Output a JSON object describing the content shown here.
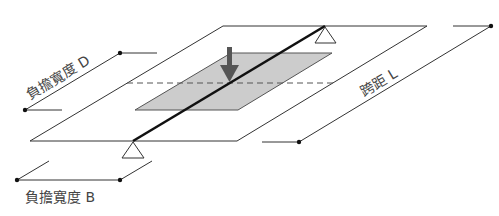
{
  "diagram": {
    "labels": {
      "load_width_d": "負擔寬度 D",
      "span_l": "跨距 L",
      "load_width_b": "負擔寬度 B"
    },
    "colors": {
      "line": "#333333",
      "beam": "#111111",
      "shaded_area": "#cccccc",
      "arrow": "#555555",
      "text": "#444444"
    },
    "elements": {
      "slab": "parallelogram plate",
      "beam": "diagonal beam across slab with two triangular supports",
      "load_area": "shaded tributary area",
      "load_arrow": "downward load arrow",
      "center_line": "dashed horizontal line"
    }
  }
}
